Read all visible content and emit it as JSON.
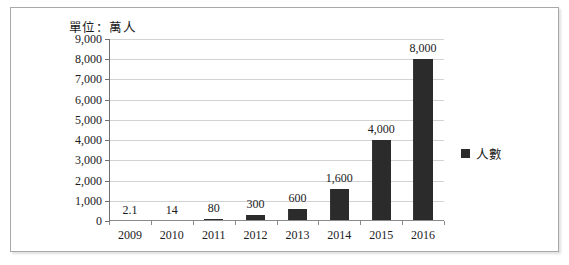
{
  "figure": {
    "unit_caption": "單位：萬人"
  },
  "legend": {
    "marker": "square-marker",
    "label": "人數",
    "color": "#2b2b2b"
  },
  "chart_data": {
    "type": "bar",
    "title": "單位：萬人",
    "xlabel": "",
    "ylabel": "",
    "ylim": [
      0,
      9000
    ],
    "ytick_step": 1000,
    "grid": true,
    "legend_position": "right",
    "bar_color": "#2b2b2b",
    "categories": [
      "2009",
      "2010",
      "2011",
      "2012",
      "2013",
      "2014",
      "2015",
      "2016"
    ],
    "values": [
      2.1,
      14,
      80,
      300,
      600,
      1600,
      4000,
      8000
    ],
    "data_labels": [
      "2.1",
      "14",
      "80",
      "300",
      "600",
      "1,600",
      "4,000",
      "8,000"
    ],
    "ytick_labels": [
      "0",
      "1,000",
      "2,000",
      "3,000",
      "4,000",
      "5,000",
      "6,000",
      "7,000",
      "8,000",
      "9,000"
    ],
    "series": [
      {
        "name": "人數",
        "values": [
          2.1,
          14,
          80,
          300,
          600,
          1600,
          4000,
          8000
        ]
      }
    ]
  }
}
